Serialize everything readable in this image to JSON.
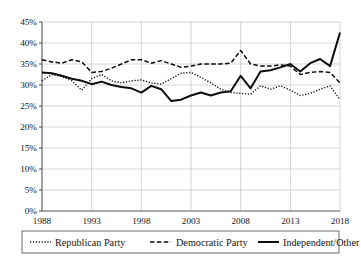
{
  "chart_data": {
    "type": "line",
    "title": "",
    "xlabel": "",
    "ylabel": "",
    "xlim": [
      1988,
      2018
    ],
    "ylim": [
      0,
      45
    ],
    "grid": true,
    "legend_position": "bottom",
    "x_tick_labels": [
      "1988",
      "1993",
      "1998",
      "2003",
      "2008",
      "2013",
      "2018"
    ],
    "x_ticks": [
      1988,
      1993,
      1998,
      2003,
      2008,
      2013,
      2018
    ],
    "y_tick_labels": [
      "0%",
      "5%",
      "10%",
      "15%",
      "20%",
      "25%",
      "30%",
      "35%",
      "40%",
      "45%"
    ],
    "y_ticks": [
      0,
      5,
      10,
      15,
      20,
      25,
      30,
      35,
      40,
      45
    ],
    "x": [
      1988,
      1989,
      1990,
      1991,
      1992,
      1993,
      1994,
      1995,
      1996,
      1997,
      1998,
      1999,
      2000,
      2001,
      2002,
      2003,
      2004,
      2005,
      2006,
      2007,
      2008,
      2009,
      2010,
      2011,
      2012,
      2013,
      2014,
      2015,
      2016,
      2017,
      2018
    ],
    "series": [
      {
        "name": "Republican Party",
        "style": "dotted",
        "color": "#0d0d0d",
        "values": [
          31.0,
          32.5,
          32.0,
          31.0,
          28.8,
          31.5,
          32.5,
          31.0,
          30.5,
          31.0,
          31.2,
          30.5,
          30.2,
          31.5,
          32.8,
          33.0,
          31.8,
          30.5,
          29.0,
          28.2,
          28.0,
          27.8,
          29.8,
          29.0,
          29.8,
          28.8,
          27.5,
          28.0,
          29.0,
          29.8,
          26.5
        ]
      },
      {
        "name": "Democratic Party",
        "style": "dashed",
        "color": "#0d0d0d",
        "values": [
          36.0,
          35.5,
          35.2,
          36.0,
          35.5,
          33.0,
          33.2,
          34.0,
          35.0,
          36.0,
          36.0,
          35.2,
          35.8,
          35.0,
          34.2,
          34.5,
          35.0,
          35.0,
          35.0,
          35.2,
          38.2,
          35.0,
          34.5,
          34.5,
          34.8,
          34.5,
          32.5,
          33.0,
          33.2,
          33.0,
          30.5
        ]
      },
      {
        "name": "Independent/Other",
        "style": "solid",
        "color": "#0d0d0d",
        "values": [
          33.0,
          32.8,
          32.2,
          31.5,
          31.0,
          30.2,
          30.8,
          30.0,
          29.5,
          29.2,
          28.2,
          29.8,
          29.0,
          26.2,
          26.5,
          27.5,
          28.2,
          27.5,
          28.2,
          28.5,
          32.2,
          29.2,
          33.2,
          33.5,
          34.2,
          35.0,
          33.2,
          35.2,
          36.2,
          34.5,
          42.5
        ]
      }
    ]
  },
  "legend": {
    "items": [
      {
        "label": "Republican Party",
        "style": "dotted"
      },
      {
        "label": "Democratic Party",
        "style": "dashed"
      },
      {
        "label": "Independent/Other",
        "style": "solid"
      }
    ]
  }
}
